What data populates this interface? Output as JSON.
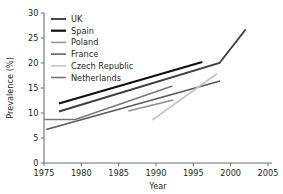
{
  "chart_data": {
    "type": "line",
    "title": "",
    "xlabel": "Year",
    "ylabel": "Prevalence (%)",
    "xlim": [
      1975,
      2005
    ],
    "ylim": [
      0,
      30
    ],
    "xticks": [
      1975,
      1980,
      1985,
      1990,
      1995,
      2000,
      2005
    ],
    "yticks": [
      0,
      5,
      10,
      15,
      20,
      25,
      30
    ],
    "xtick_labels": [
      "1975",
      "1980",
      "1985",
      "1990",
      "1995",
      "2000",
      "2005"
    ],
    "ytick_labels": [
      "0",
      "5",
      "10",
      "15",
      "20",
      "25",
      "30"
    ],
    "grid": false,
    "legend_position": "upper left",
    "series": [
      {
        "name": "UK",
        "color": "#3f3f41",
        "width": 1.9,
        "x": [
          1977,
          1998.5,
          2002
        ],
        "y": [
          10.3,
          20.0,
          26.7
        ]
      },
      {
        "name": "Spain",
        "color": "#0f0f11",
        "width": 2.2,
        "x": [
          1977,
          1996.2
        ],
        "y": [
          11.9,
          20.2
        ]
      },
      {
        "name": "Poland",
        "color": "#8e8f92",
        "width": 1.5,
        "x": [
          1986.3,
          1992.3
        ],
        "y": [
          10.4,
          12.6
        ]
      },
      {
        "name": "France",
        "color": "#57585b",
        "width": 1.5,
        "x": [
          1975.3,
          1998.6
        ],
        "y": [
          6.7,
          16.4
        ]
      },
      {
        "name": "Czech Republic",
        "color": "#c4c5c7",
        "width": 1.6,
        "x": [
          1989.5,
          1998.2
        ],
        "y": [
          8.6,
          17.9
        ]
      },
      {
        "name": "Netherlands",
        "color": "#76777a",
        "width": 1.6,
        "x": [
          1975.0,
          1979.2,
          1992.2
        ],
        "y": [
          8.7,
          8.7,
          15.4
        ]
      }
    ],
    "annotations": []
  },
  "legend": {
    "entries": [
      {
        "label": "UK"
      },
      {
        "label": "Spain"
      },
      {
        "label": "Poland"
      },
      {
        "label": "France"
      },
      {
        "label": "Czech Republic"
      },
      {
        "label": "Netherlands"
      }
    ]
  }
}
